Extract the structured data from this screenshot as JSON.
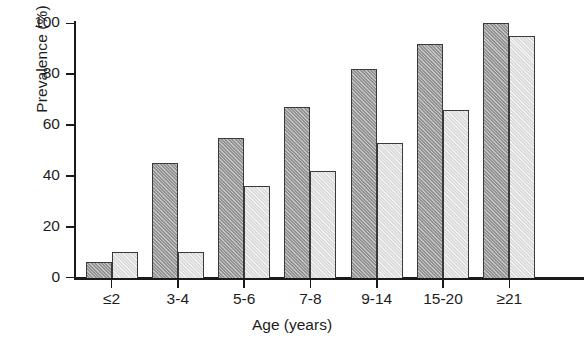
{
  "chart_data": {
    "type": "bar",
    "title": "",
    "xlabel": "Age (years)",
    "ylabel": "Prevalence (%)",
    "categories": [
      "≤2",
      "3-4",
      "5-6",
      "7-8",
      "9-14",
      "15-20",
      "≥21"
    ],
    "series": [
      {
        "name": "series-1",
        "fill": "dark-hatched",
        "color": "#9b9b9b",
        "values": [
          6,
          45,
          55,
          67,
          82,
          92,
          100
        ]
      },
      {
        "name": "series-2",
        "fill": "light",
        "color": "#e2e2e2",
        "values": [
          10,
          10,
          36,
          42,
          53,
          66,
          95
        ]
      }
    ],
    "ylim": [
      0,
      100
    ],
    "yticks": [
      0,
      20,
      40,
      60,
      80,
      100
    ],
    "ytick_labels": [
      "0",
      "20",
      "40",
      "60",
      "80",
      "100"
    ],
    "grid": false,
    "legend": null,
    "legend_position": "none"
  }
}
